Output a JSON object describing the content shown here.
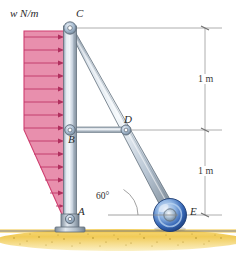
{
  "figure": {
    "type": "statics-free-body-diagram",
    "colors": {
      "load_fill": "#e88fad",
      "load_edge": "#cf3f70",
      "member_light": "#e9eef4",
      "member_mid": "#b9c6d4",
      "member_dark": "#7e8c9c",
      "roller_blue": "#2f62b4",
      "roller_light": "#a9c7e8",
      "ground": "#f3cf63",
      "dimension_line": "#9a9a9a"
    }
  },
  "labels": {
    "load_intensity": "w  N/m",
    "joint_c": "C",
    "joint_b": "B",
    "joint_d": "D",
    "joint_a": "A",
    "joint_e": "E",
    "angle": "60°"
  },
  "dimensions": {
    "upper": "1 m",
    "lower": "1 m"
  },
  "geometry": {
    "point_c": [
      70,
      28
    ],
    "point_b": [
      70,
      130
    ],
    "point_a": [
      70,
      222
    ],
    "point_d": [
      124,
      130
    ],
    "point_e": [
      170,
      215
    ],
    "angle_degrees": 60,
    "column_axis_x": 70,
    "dimension_axis_x": 205,
    "ground_y": 232
  }
}
